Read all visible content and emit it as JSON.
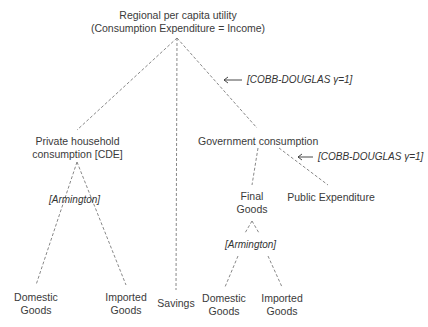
{
  "root": {
    "line1": "Regional per capita utility",
    "line2": "(Consumption Expenditure = Income)"
  },
  "private": {
    "line1": "Private household",
    "line2": "consumption [CDE]"
  },
  "government": {
    "label": "Government consumption"
  },
  "final_goods": {
    "line1": "Final",
    "line2": "Goods"
  },
  "public_expenditure": {
    "label": "Public Expenditure"
  },
  "savings": {
    "label": "Savings"
  },
  "leaves": {
    "private_domestic": {
      "line1": "Domestic",
      "line2": "Goods"
    },
    "private_imported": {
      "line1": "Imported",
      "line2": "Goods"
    },
    "gov_domestic": {
      "line1": "Domestic",
      "line2": "Goods"
    },
    "gov_imported": {
      "line1": "Imported",
      "line2": "Goods"
    }
  },
  "annotations": {
    "top_cobb_douglas": "[COBB-DOUGLAS γ=1]",
    "gov_cobb_douglas": "[COBB-DOUGLAS γ=1]",
    "private_armington": "[Armington]",
    "gov_armington": "[Armington]",
    "arrow_glyph": "⟵"
  }
}
